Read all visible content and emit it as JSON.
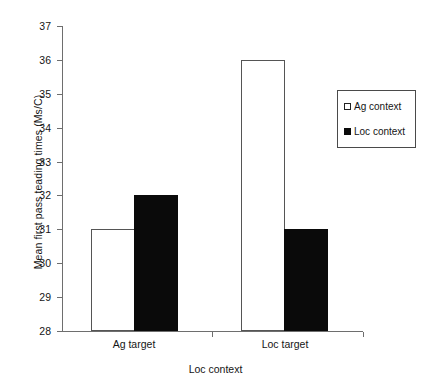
{
  "chart_data": {
    "type": "bar",
    "title": "",
    "subtitle": "",
    "categories": [
      "Ag target",
      "Loc target"
    ],
    "series": [
      {
        "name": "Ag context",
        "values": [
          31,
          36
        ],
        "fill": "#ffffff",
        "stroke": "#555555"
      },
      {
        "name": "Loc context",
        "values": [
          32,
          31
        ],
        "fill": "#0a0a0a",
        "stroke": "#0a0a0a"
      }
    ],
    "xlabel": "Loc context",
    "ylabel": "Mean first pass teading times (Ms/C)",
    "ylim": [
      28,
      37
    ],
    "ytick_step": 1,
    "yticks": [
      28,
      29,
      30,
      31,
      32,
      33,
      34,
      35,
      36,
      37
    ],
    "ytick_labels": [
      "28",
      "29",
      "30",
      "31",
      "32",
      "33",
      "34",
      "35",
      "36",
      "37"
    ],
    "grid": false,
    "legend_position": "upper-right",
    "legend_entries": [
      "Ag context",
      "Loc context"
    ],
    "axis_color": "#6e6e6e",
    "text_color": "#151515",
    "background": "#ffffff"
  },
  "legend": {
    "items": [
      {
        "label": "Ag context",
        "marker": "hollow-square-marker"
      },
      {
        "label": "Loc context",
        "marker": "filled-square-marker"
      }
    ]
  }
}
